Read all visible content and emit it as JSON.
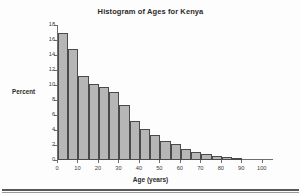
{
  "chart_data": {
    "type": "bar",
    "title": "Histogram of Ages for Kenya",
    "xlabel": "Age (years)",
    "ylabel": "Percent",
    "xlim": [
      0,
      105
    ],
    "ylim": [
      0,
      18
    ],
    "grid": false,
    "legend": null,
    "bin_width": 5,
    "bin_starts": [
      0,
      5,
      10,
      15,
      20,
      25,
      30,
      35,
      40,
      45,
      50,
      55,
      60,
      65,
      70,
      75,
      80,
      85
    ],
    "categories": [
      "0-5",
      "5-10",
      "10-15",
      "15-20",
      "20-25",
      "25-30",
      "30-35",
      "35-40",
      "40-45",
      "45-50",
      "50-55",
      "55-60",
      "60-65",
      "65-70",
      "70-75",
      "75-80",
      "80-85",
      "85-90"
    ],
    "values": [
      16.9,
      14.75,
      11.2,
      10.15,
      9.8,
      9.1,
      7.35,
      5.2,
      4.15,
      3.35,
      2.6,
      2.1,
      1.5,
      1.1,
      0.85,
      0.55,
      0.4,
      0.12
    ],
    "x_ticks": [
      0,
      10,
      20,
      30,
      40,
      50,
      60,
      70,
      80,
      90,
      100
    ],
    "x_tick_labels": [
      "0",
      "10",
      "20",
      "30",
      "40",
      "50",
      "60",
      "70",
      "80",
      "90",
      "100"
    ],
    "y_ticks": [
      0,
      2,
      4,
      6,
      8,
      10,
      12,
      14,
      16,
      18
    ],
    "y_tick_labels": [
      "0",
      "2",
      "4",
      "6",
      "8",
      "10",
      "12",
      "14",
      "16",
      "18"
    ],
    "colors": {
      "bar_fill": "#b6b6b6",
      "bar_edge": "#4a4a4a",
      "axis": "#6d6d6d",
      "text": "#2b2b2b",
      "background": "#fdfdfd"
    }
  }
}
